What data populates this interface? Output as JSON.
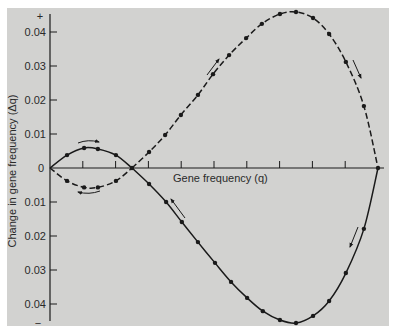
{
  "chart_data": {
    "type": "line",
    "title": "",
    "xlabel": "Gene frequency (q)",
    "ylabel": "Change in gene frequency (Δq)",
    "xlim": [
      0,
      1
    ],
    "ylim": [
      -0.046,
      0.046
    ],
    "x_ticks": [
      0.1,
      0.2,
      0.3,
      0.4,
      0.5,
      0.6,
      0.7,
      0.8,
      0.9,
      1.0
    ],
    "x_tick_labels_shown": false,
    "y_ticks_positive": [
      0.01,
      0.02,
      0.03,
      0.04
    ],
    "y_ticks_negative": [
      -0.01,
      -0.02,
      -0.03,
      -0.04
    ],
    "y_tick_labels": [
      "0.04",
      "0.03",
      "0.02",
      "0.01",
      "0",
      "0.01",
      "0.02",
      "0.03",
      "0.04"
    ],
    "y_sign_top": "+",
    "y_sign_bottom": "−",
    "origin_label": "0",
    "grid": false,
    "legend": null,
    "series": [
      {
        "name": "upper-solid-lobe",
        "style": "solid",
        "x": [
          0,
          0.052,
          0.104,
          0.146,
          0.201,
          0.25
        ],
        "y": [
          0,
          0.0038,
          0.0059,
          0.0056,
          0.0038,
          0
        ]
      },
      {
        "name": "lower-dashed-lobe",
        "style": "dashed",
        "x": [
          0,
          0.052,
          0.104,
          0.146,
          0.201,
          0.25
        ],
        "y": [
          0,
          -0.0038,
          -0.0057,
          -0.0057,
          -0.0038,
          0
        ]
      },
      {
        "name": "upper-dashed-curve",
        "style": "dashed",
        "x": [
          0.25,
          0.302,
          0.351,
          0.399,
          0.451,
          0.497,
          0.546,
          0.598,
          0.646,
          0.701,
          0.75,
          0.802,
          0.851,
          0.902,
          0.957,
          1.0
        ],
        "y": [
          0,
          0.0047,
          0.0097,
          0.0156,
          0.0215,
          0.0276,
          0.0332,
          0.0382,
          0.0424,
          0.0453,
          0.0459,
          0.0441,
          0.0394,
          0.0312,
          0.0182,
          0
        ]
      },
      {
        "name": "lower-solid-curve",
        "style": "solid",
        "x": [
          0.25,
          0.302,
          0.354,
          0.402,
          0.451,
          0.503,
          0.552,
          0.601,
          0.649,
          0.701,
          0.75,
          0.802,
          0.851,
          0.902,
          0.957,
          1.0
        ],
        "y": [
          0,
          -0.0047,
          -0.01,
          -0.0159,
          -0.0218,
          -0.0279,
          -0.0335,
          -0.0382,
          -0.0421,
          -0.0447,
          -0.0456,
          -0.0435,
          -0.0391,
          -0.0309,
          -0.0179,
          0
        ]
      }
    ],
    "annotations": [
      {
        "type": "arrow",
        "near_series": "upper-solid-lobe",
        "direction": "right"
      },
      {
        "type": "arrow",
        "near_series": "lower-dashed-lobe",
        "direction": "left"
      },
      {
        "type": "arrow",
        "near_series": "upper-dashed-curve",
        "position": "rising",
        "direction": "up-right"
      },
      {
        "type": "arrow",
        "near_series": "upper-dashed-curve",
        "position": "falling",
        "direction": "down-right"
      },
      {
        "type": "arrow",
        "near_series": "lower-solid-curve",
        "position": "descending",
        "direction": "up-left"
      },
      {
        "type": "arrow",
        "near_series": "lower-solid-curve",
        "position": "rising",
        "direction": "down-left"
      }
    ]
  },
  "colors": {
    "background": "#d2d2d0",
    "ink": "#1a1a1a"
  }
}
